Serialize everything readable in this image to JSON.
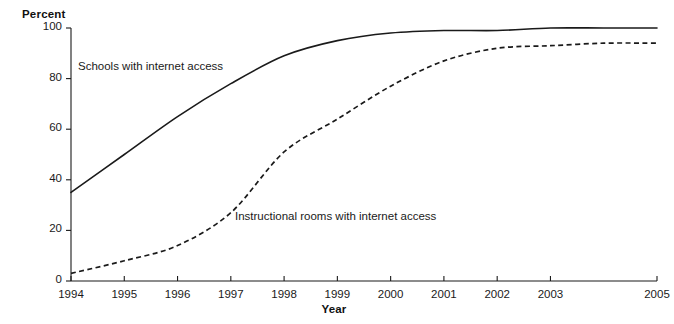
{
  "figure": {
    "cropped_title_sliver": "",
    "ylabel": "Percent",
    "xlabel": "Year",
    "annotations": {
      "schools": "Schools with internet access",
      "rooms": "Instructional rooms with internet access"
    }
  },
  "chart_data": {
    "type": "line",
    "title": "",
    "xlabel": "Year",
    "ylabel": "Percent",
    "x": [
      1994,
      1995,
      1996,
      1997,
      1998,
      1999,
      2000,
      2001,
      2002,
      2003,
      2004,
      2005
    ],
    "xtick_labels": [
      "1994",
      "1995",
      "1996",
      "1997",
      "1998",
      "1999",
      "2000",
      "2001",
      "2002",
      "2003",
      "",
      "2005"
    ],
    "ytick_labels": [
      "0",
      "20",
      "40",
      "60",
      "80",
      "100"
    ],
    "yticks": [
      0,
      20,
      40,
      60,
      80,
      100
    ],
    "xlim": [
      1994,
      2005
    ],
    "ylim": [
      0,
      100
    ],
    "grid": false,
    "legend_position": "inline-annotations",
    "series": [
      {
        "name": "Schools with internet access",
        "style": "solid",
        "color": "#1a1a1a",
        "values": [
          35,
          50,
          65,
          78,
          89,
          95,
          98,
          99,
          99,
          100,
          100,
          100
        ]
      },
      {
        "name": "Instructional rooms with internet access",
        "style": "dashed",
        "color": "#1a1a1a",
        "values": [
          3,
          8,
          14,
          27,
          51,
          64,
          77,
          87,
          92,
          93,
          94,
          94
        ]
      }
    ]
  }
}
